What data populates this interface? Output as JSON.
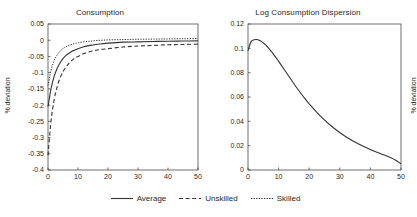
{
  "figure": {
    "ylabel_shared": "% deviation"
  },
  "legend": {
    "position": "bottom-center",
    "entries": [
      {
        "label": "Average",
        "style": "solid"
      },
      {
        "label": "Unskilled",
        "style": "dashed"
      },
      {
        "label": "Skilled",
        "style": "dotted"
      }
    ]
  },
  "chart_data": [
    {
      "type": "line",
      "title": "Consumption",
      "xlabel": "",
      "ylabel": "% deviation",
      "xlim": [
        0,
        50
      ],
      "ylim": [
        -0.4,
        0.05
      ],
      "xticks": [
        0,
        10,
        20,
        30,
        40,
        50
      ],
      "yticks": [
        -0.4,
        -0.35,
        -0.3,
        -0.25,
        -0.2,
        -0.15,
        -0.1,
        -0.05,
        0,
        0.05
      ],
      "ytick_labels": [
        "-0.4",
        "-0.35",
        "-0.3",
        "-0.25",
        "-0.2",
        "-0.15",
        "-0.1",
        "-0.05",
        "0",
        "0.05"
      ],
      "grid": false,
      "x": [
        0,
        1,
        2,
        3,
        4,
        5,
        6,
        7,
        8,
        9,
        10,
        12,
        14,
        16,
        18,
        20,
        25,
        30,
        35,
        40,
        45,
        50
      ],
      "series": [
        {
          "name": "Average",
          "style": "solid",
          "values": [
            -0.205,
            -0.15,
            -0.113,
            -0.088,
            -0.07,
            -0.057,
            -0.047,
            -0.04,
            -0.034,
            -0.03,
            -0.026,
            -0.02,
            -0.016,
            -0.013,
            -0.011,
            -0.009,
            -0.006,
            -0.005,
            -0.004,
            -0.003,
            -0.0025,
            -0.002
          ]
        },
        {
          "name": "Unskilled",
          "style": "dashed",
          "values": [
            -0.355,
            -0.25,
            -0.186,
            -0.145,
            -0.117,
            -0.097,
            -0.082,
            -0.071,
            -0.062,
            -0.055,
            -0.05,
            -0.041,
            -0.035,
            -0.031,
            -0.028,
            -0.026,
            -0.021,
            -0.018,
            -0.016,
            -0.014,
            -0.013,
            -0.012
          ]
        },
        {
          "name": "Skilled",
          "style": "dotted",
          "values": [
            -0.14,
            -0.093,
            -0.064,
            -0.046,
            -0.034,
            -0.026,
            -0.02,
            -0.016,
            -0.013,
            -0.01,
            -0.008,
            -0.005,
            -0.003,
            -0.001,
            0.0,
            0.001,
            0.002,
            0.003,
            0.0035,
            0.004,
            0.0045,
            0.005
          ]
        }
      ]
    },
    {
      "type": "line",
      "title": "Log Consumption Dispersion",
      "xlabel": "",
      "ylabel": "% deviation",
      "xlim": [
        0,
        50
      ],
      "ylim": [
        0,
        0.12
      ],
      "xticks": [
        0,
        10,
        20,
        30,
        40,
        50
      ],
      "yticks": [
        0,
        0.02,
        0.04,
        0.06,
        0.08,
        0.1,
        0.12
      ],
      "ytick_labels": [
        "0",
        "0.02",
        "0.04",
        "0.06",
        "0.08",
        "0.1",
        "0.12"
      ],
      "grid": false,
      "x": [
        0,
        1,
        2,
        3,
        4,
        5,
        6,
        8,
        10,
        12,
        14,
        16,
        18,
        20,
        24,
        28,
        32,
        36,
        40,
        44,
        48,
        50
      ],
      "series": [
        {
          "name": "Average",
          "style": "solid",
          "values": [
            0.098,
            0.1055,
            0.107,
            0.1072,
            0.1062,
            0.1045,
            0.1022,
            0.0962,
            0.0893,
            0.082,
            0.0746,
            0.0674,
            0.0606,
            0.0543,
            0.0434,
            0.0345,
            0.0273,
            0.0215,
            0.0168,
            0.0128,
            0.0084,
            0.005
          ]
        }
      ]
    }
  ]
}
